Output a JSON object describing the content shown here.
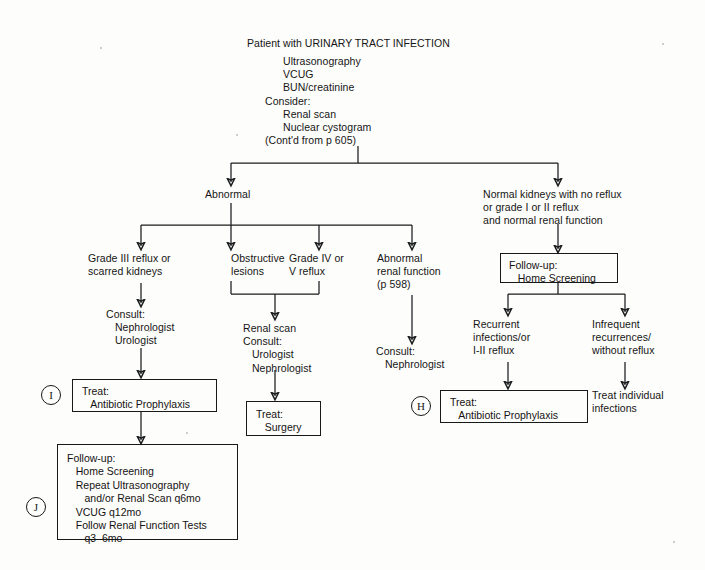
{
  "diagram": {
    "title": "Patient with URINARY TRACT INFECTION",
    "type": "clinical-algorithm-flowchart"
  },
  "header": {
    "title": "Patient with URINARY TRACT INFECTION",
    "workup_lines": "Ultrasonography\nVCUG\nBUN/creatinine",
    "consider_label": "Consider:",
    "consider_items": "Renal scan\nNuclear cystogram",
    "continuation": "(Cont'd from p 605)"
  },
  "branches": {
    "abnormal": "Abnormal",
    "normal": "Normal kidneys with no reflux\nor grade I or II reflux\nand normal renal function"
  },
  "abnormal_children": {
    "grade_iii": "Grade III reflux or\nscarred kidneys",
    "obstructive": "Obstructive\nlesions",
    "grade_iv_v": "Grade IV or\nV reflux",
    "abnormal_renal": "Abnormal\nrenal function\n(p 598)"
  },
  "consults": {
    "grade_iii_consult": "Consult:\n   Nephrologist\n   Urologist",
    "obstructive_consult": "Renal scan\nConsult:\n   Urologist\n   Nephrologist",
    "renal_consult": "Consult:\n   Nephrologist"
  },
  "normal_children": {
    "recurrent": "Recurrent\ninfections/or\nI-II reflux",
    "infrequent": "Infrequent\nrecurrences/\nwithout reflux",
    "treat_individual": "Treat individual\ninfections"
  },
  "boxes": {
    "followup_home": "Follow-up:\n   Home Screening",
    "treat_antibiotic_left": "Treat:\n   Antibiotic Prophylaxis",
    "treat_antibiotic_right": "Treat:\n   Antibiotic Prophylaxis",
    "treat_surgery": "Treat:\n   Surgery",
    "followup_long": "Follow-up:\n   Home Screening\n   Repeat Ultrasonography\n      and/or Renal Scan q6mo\n   VCUG q12mo\n   Follow Renal Function Tests\n      q3–6mo"
  },
  "markers": {
    "h": "H",
    "i": "I",
    "j": "J"
  },
  "colors": {
    "ink": "#1a1c1d",
    "paper": "#fdfdfb"
  }
}
